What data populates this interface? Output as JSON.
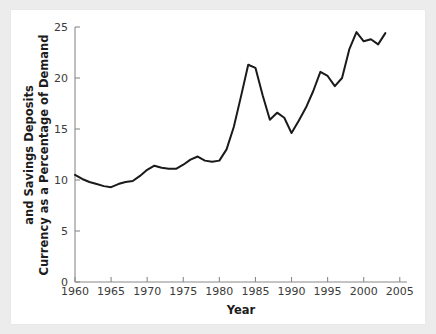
{
  "figure": {
    "background_color": "#ececed",
    "canvas_color": "#ffffff",
    "line_color": "#1a1a1a",
    "axis_color": "#8a8a8a"
  },
  "chart_data": {
    "type": "line",
    "title": "",
    "xlabel": "Year",
    "ylabel": "Currency as a Percentage of Demand and Savings Deposits",
    "ylabel_line1": "Currency as a Percentage of Demand",
    "ylabel_line2": "and Savings Deposits",
    "xlim": [
      1960,
      2006
    ],
    "ylim": [
      0,
      25
    ],
    "grid": false,
    "legend": false,
    "xticks": [
      1960,
      1965,
      1970,
      1975,
      1980,
      1985,
      1990,
      1995,
      2000,
      2005
    ],
    "xtick_labels": [
      "1960",
      "1965",
      "1970",
      "1975",
      "1980",
      "1985",
      "1990",
      "1995",
      "2000",
      "2005"
    ],
    "yticks": [
      0,
      5,
      10,
      15,
      20,
      25
    ],
    "ytick_labels": [
      "0",
      "5",
      "10",
      "15",
      "20",
      "25"
    ],
    "series": [
      {
        "name": "Currency as a Percentage of Demand and Savings Deposits",
        "x": [
          1960,
          1961,
          1962,
          1963,
          1964,
          1965,
          1966,
          1967,
          1968,
          1969,
          1970,
          1971,
          1972,
          1973,
          1974,
          1975,
          1976,
          1977,
          1978,
          1979,
          1980,
          1981,
          1982,
          1983,
          1984,
          1985,
          1986,
          1987,
          1988,
          1989,
          1990,
          1991,
          1992,
          1993,
          1994,
          1995,
          1996,
          1997,
          1998,
          1999,
          2000,
          2001,
          2002,
          2003
        ],
        "values": [
          10.5,
          10.1,
          9.8,
          9.6,
          9.4,
          9.3,
          9.6,
          9.8,
          9.9,
          10.4,
          11.0,
          11.4,
          11.2,
          11.1,
          11.1,
          11.5,
          12.0,
          12.3,
          11.9,
          11.8,
          11.9,
          13.0,
          15.2,
          18.2,
          21.3,
          21.0,
          18.3,
          15.9,
          16.6,
          16.1,
          14.6,
          15.8,
          17.1,
          18.7,
          20.6,
          20.2,
          19.2,
          20.0,
          22.8,
          24.5,
          23.6,
          23.8,
          23.3,
          24.4
        ]
      }
    ]
  }
}
